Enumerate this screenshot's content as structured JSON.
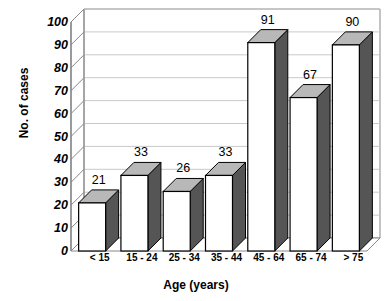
{
  "chart_data": {
    "type": "bar",
    "title": "",
    "xlabel": "Age (years)",
    "ylabel": "No. of cases",
    "categories": [
      "< 15",
      "15 - 24",
      "25 - 34",
      "35 - 44",
      "45 - 64",
      "65 - 74",
      "> 75"
    ],
    "values": [
      21,
      33,
      26,
      33,
      91,
      67,
      90
    ],
    "data_labels": [
      "21",
      "33",
      "26",
      "33",
      "91",
      "67",
      "90"
    ],
    "ylim": [
      0,
      100
    ],
    "ytick_labels": [
      "0",
      "10",
      "20",
      "30",
      "40",
      "50",
      "60",
      "70",
      "80",
      "90",
      "100"
    ],
    "ytick_values": [
      0,
      10,
      20,
      30,
      40,
      50,
      60,
      70,
      80,
      90,
      100
    ],
    "grid": true,
    "legend": false,
    "style": "3d-column",
    "colors": {
      "bar_front": "#ffffff",
      "bar_side": "#555555",
      "bar_top": "#b8b8b8",
      "bar_outline": "#000000",
      "gridline": "#c9c9c9",
      "axis": "#888888",
      "text": "#000000",
      "background": "#ffffff"
    }
  }
}
